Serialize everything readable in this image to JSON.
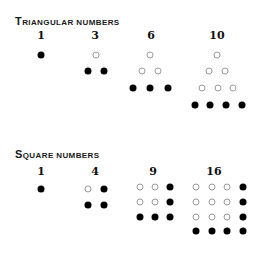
{
  "sections": [
    {
      "title_cap": "T",
      "title_rest": "riangular numbers",
      "title": "Triangular numbers",
      "title_y": 15,
      "label_y": 29,
      "groups": [
        {
          "label": "1",
          "label_x": 41,
          "dots": [
            {
              "x": 41,
              "y": 55,
              "filled": true
            }
          ]
        },
        {
          "label": "3",
          "label_x": 95,
          "dots": [
            {
              "x": 96,
              "y": 55,
              "filled": false
            },
            {
              "x": 88,
              "y": 71,
              "filled": true
            },
            {
              "x": 104,
              "y": 71,
              "filled": true
            }
          ]
        },
        {
          "label": "6",
          "label_x": 151,
          "dots": [
            {
              "x": 150,
              "y": 55,
              "filled": false
            },
            {
              "x": 142,
              "y": 71,
              "filled": false
            },
            {
              "x": 158,
              "y": 71,
              "filled": false
            },
            {
              "x": 133,
              "y": 88,
              "filled": true
            },
            {
              "x": 150,
              "y": 88,
              "filled": true
            },
            {
              "x": 168,
              "y": 88,
              "filled": true
            }
          ]
        },
        {
          "label": "10",
          "label_x": 217,
          "dots": [
            {
              "x": 217,
              "y": 55,
              "filled": false
            },
            {
              "x": 209,
              "y": 71,
              "filled": false
            },
            {
              "x": 225,
              "y": 71,
              "filled": false
            },
            {
              "x": 202,
              "y": 88,
              "filled": false
            },
            {
              "x": 218,
              "y": 88,
              "filled": false
            },
            {
              "x": 233,
              "y": 88,
              "filled": false
            },
            {
              "x": 195,
              "y": 105,
              "filled": true
            },
            {
              "x": 210,
              "y": 105,
              "filled": true
            },
            {
              "x": 226,
              "y": 105,
              "filled": true
            },
            {
              "x": 242,
              "y": 105,
              "filled": true
            }
          ]
        }
      ]
    },
    {
      "title_cap": "S",
      "title_rest": "quare numbers",
      "title": "Square numbers",
      "title_y": 148,
      "label_y": 165,
      "groups": [
        {
          "label": "1",
          "label_x": 41,
          "dots": [
            {
              "x": 41,
              "y": 189,
              "filled": true
            }
          ]
        },
        {
          "label": "4",
          "label_x": 95,
          "dots": [
            {
              "x": 88,
              "y": 189,
              "filled": false
            },
            {
              "x": 104,
              "y": 189,
              "filled": true
            },
            {
              "x": 88,
              "y": 205,
              "filled": true
            },
            {
              "x": 104,
              "y": 205,
              "filled": true
            }
          ]
        },
        {
          "label": "9",
          "label_x": 153,
          "dots": [
            {
              "x": 140,
              "y": 187,
              "filled": false
            },
            {
              "x": 155,
              "y": 187,
              "filled": false
            },
            {
              "x": 170,
              "y": 187,
              "filled": true
            },
            {
              "x": 140,
              "y": 202,
              "filled": false
            },
            {
              "x": 155,
              "y": 202,
              "filled": false
            },
            {
              "x": 170,
              "y": 202,
              "filled": true
            },
            {
              "x": 140,
              "y": 217,
              "filled": true
            },
            {
              "x": 155,
              "y": 217,
              "filled": true
            },
            {
              "x": 170,
              "y": 217,
              "filled": true
            }
          ]
        },
        {
          "label": "16",
          "label_x": 214,
          "dots": [
            {
              "x": 196,
              "y": 187,
              "filled": false
            },
            {
              "x": 212,
              "y": 187,
              "filled": false
            },
            {
              "x": 227,
              "y": 187,
              "filled": false
            },
            {
              "x": 243,
              "y": 187,
              "filled": true
            },
            {
              "x": 196,
              "y": 202,
              "filled": false
            },
            {
              "x": 212,
              "y": 202,
              "filled": false
            },
            {
              "x": 227,
              "y": 202,
              "filled": false
            },
            {
              "x": 243,
              "y": 202,
              "filled": true
            },
            {
              "x": 196,
              "y": 217,
              "filled": false
            },
            {
              "x": 212,
              "y": 217,
              "filled": false
            },
            {
              "x": 227,
              "y": 217,
              "filled": false
            },
            {
              "x": 243,
              "y": 217,
              "filled": true
            },
            {
              "x": 196,
              "y": 231,
              "filled": true
            },
            {
              "x": 212,
              "y": 231,
              "filled": true
            },
            {
              "x": 227,
              "y": 231,
              "filled": true
            },
            {
              "x": 243,
              "y": 231,
              "filled": true
            }
          ]
        }
      ]
    }
  ]
}
